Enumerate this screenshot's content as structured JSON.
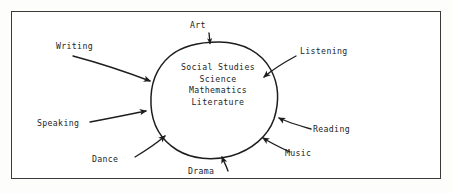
{
  "diagram": {
    "title_visible": false,
    "frame": {
      "border_color": "#3a3a3a",
      "background": "#ffffff"
    },
    "text_color": "#1d1d1d",
    "center": {
      "shape_name": "hand-drawn-circle",
      "lines": [
        "Social Studies",
        "Science",
        "Mathematics",
        "Literature"
      ]
    },
    "labels": [
      {
        "id": "art",
        "text": "Art",
        "position": "top"
      },
      {
        "id": "writing",
        "text": "Writing",
        "position": "upper-left"
      },
      {
        "id": "listening",
        "text": "Listening",
        "position": "upper-right"
      },
      {
        "id": "speaking",
        "text": "Speaking",
        "position": "left"
      },
      {
        "id": "reading",
        "text": "Reading",
        "position": "right"
      },
      {
        "id": "dance",
        "text": "Dance",
        "position": "lower-left"
      },
      {
        "id": "music",
        "text": "Music",
        "position": "lower-right"
      },
      {
        "id": "drama",
        "text": "Drama",
        "position": "bottom"
      }
    ]
  }
}
